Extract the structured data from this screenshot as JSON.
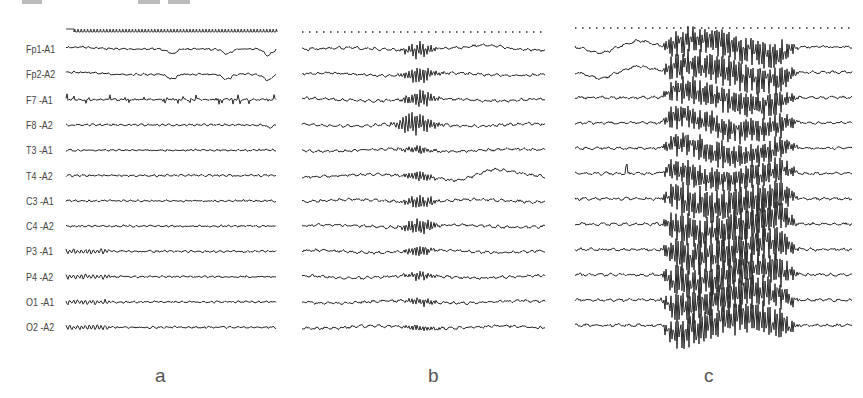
{
  "figure": {
    "type": "EEG recording comparison",
    "channels": [
      "Fp1-A1",
      "Fp2-A2",
      "F7 -A1",
      "F8 -A2",
      "T3 -A1",
      "T4 -A2",
      "C3 -A1",
      "C4 -A2",
      "P3 -A1",
      "P4 -A2",
      "O1 -A1",
      "O2 -A2"
    ],
    "panels": [
      {
        "id": "a",
        "label": "a",
        "description": "baseline EEG with eye-movement artifacts in frontal leads and muscle artifact in F7"
      },
      {
        "id": "b",
        "label": "b",
        "description": "focal burst of sharp/spike activity mid-record, most prominent in Fp1, Fp2, F7, F8, C4"
      },
      {
        "id": "c",
        "label": "c",
        "description": "generalized high-amplitude paroxysmal discharge across all channels"
      }
    ],
    "colors": {
      "trace": "#2a2a2a",
      "label": "#444444",
      "background": "#ffffff"
    }
  }
}
